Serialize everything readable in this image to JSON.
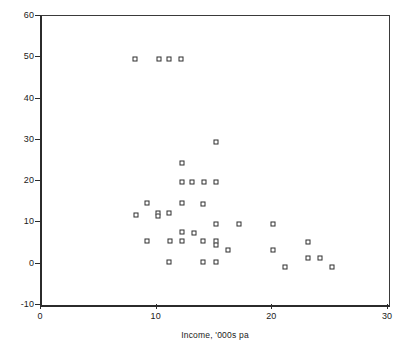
{
  "chart_data": {
    "type": "scatter",
    "title": "",
    "xlabel": "Income, '000s pa",
    "ylabel": "Sports participation in 3 months",
    "xlim": [
      0,
      30
    ],
    "ylim": [
      -10,
      60
    ],
    "xticks": [
      0,
      10,
      20,
      30
    ],
    "yticks": [
      -10,
      0,
      10,
      20,
      30,
      40,
      50,
      60
    ],
    "xtick_labels": [
      "0",
      "10",
      "20",
      "30"
    ],
    "ytick_labels": [
      "-10",
      "0",
      "10",
      "20",
      "30",
      "40",
      "50",
      "60"
    ],
    "grid": false,
    "legend": "none",
    "marker": "open-square",
    "marker_color": "#2e2e2e",
    "marker_fill": "#ffffff",
    "axis_color": "#2b2b2b",
    "background": "#ffffff",
    "points": [
      {
        "x": 8.0,
        "y": 49.7
      },
      {
        "x": 10.1,
        "y": 49.7
      },
      {
        "x": 11.0,
        "y": 49.7
      },
      {
        "x": 12.0,
        "y": 49.7
      },
      {
        "x": 15.0,
        "y": 29.4
      },
      {
        "x": 12.1,
        "y": 24.4
      },
      {
        "x": 12.1,
        "y": 19.7
      },
      {
        "x": 13.0,
        "y": 19.7
      },
      {
        "x": 14.0,
        "y": 19.7
      },
      {
        "x": 15.0,
        "y": 19.7
      },
      {
        "x": 9.1,
        "y": 14.7
      },
      {
        "x": 12.1,
        "y": 14.7
      },
      {
        "x": 13.9,
        "y": 14.5
      },
      {
        "x": 10.0,
        "y": 12.4
      },
      {
        "x": 11.0,
        "y": 12.4
      },
      {
        "x": 10.0,
        "y": 11.6
      },
      {
        "x": 8.1,
        "y": 11.7
      },
      {
        "x": 15.0,
        "y": 9.6
      },
      {
        "x": 17.0,
        "y": 9.6
      },
      {
        "x": 20.0,
        "y": 9.5
      },
      {
        "x": 12.1,
        "y": 7.6
      },
      {
        "x": 13.1,
        "y": 7.5
      },
      {
        "x": 9.1,
        "y": 5.5
      },
      {
        "x": 11.1,
        "y": 5.5
      },
      {
        "x": 12.1,
        "y": 5.4
      },
      {
        "x": 13.9,
        "y": 5.4
      },
      {
        "x": 15.0,
        "y": 5.5
      },
      {
        "x": 15.0,
        "y": 4.6
      },
      {
        "x": 16.1,
        "y": 3.4
      },
      {
        "x": 20.0,
        "y": 3.4
      },
      {
        "x": 23.0,
        "y": 5.2
      },
      {
        "x": 23.0,
        "y": 1.3
      },
      {
        "x": 24.0,
        "y": 1.3
      },
      {
        "x": 11.0,
        "y": 0.5
      },
      {
        "x": 13.9,
        "y": 0.5
      },
      {
        "x": 15.0,
        "y": 0.5
      },
      {
        "x": 21.0,
        "y": -0.7
      },
      {
        "x": 25.1,
        "y": -0.7
      }
    ]
  }
}
